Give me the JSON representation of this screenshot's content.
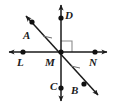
{
  "figure": {
    "type": "geometry-diagram",
    "colors": {
      "line": "#1a1a1a",
      "point": "#111111",
      "label": "#1a1a1a",
      "right_angle": "#8c8c8c",
      "tick": "#6e6e6e",
      "background": "#ffffff"
    },
    "width": 114,
    "height": 106
  },
  "points": [
    {
      "name": "point-a",
      "label": "A",
      "x": 32,
      "y": 22,
      "label_x": 23,
      "label_y": 30
    },
    {
      "name": "point-d",
      "label": "D",
      "x": 61,
      "y": 18,
      "label_x": 65,
      "label_y": 10
    },
    {
      "name": "point-l",
      "label": "L",
      "x": 23,
      "y": 52,
      "label_x": 17,
      "label_y": 57
    },
    {
      "name": "point-m",
      "label": "M",
      "x": 61,
      "y": 52,
      "label_x": 45,
      "label_y": 57
    },
    {
      "name": "point-n",
      "label": "N",
      "x": 95,
      "y": 52,
      "label_x": 89,
      "label_y": 57
    },
    {
      "name": "point-c",
      "label": "C",
      "x": 61,
      "y": 88,
      "label_x": 50,
      "label_y": 81
    },
    {
      "name": "point-b",
      "label": "B",
      "x": 84,
      "y": 84,
      "label_x": 71,
      "label_y": 85
    }
  ],
  "lines": [
    {
      "name": "line-ln",
      "description": "horizontal line through L, M, N with arrowheads both ends",
      "x1": 8,
      "y1": 52,
      "x2": 108,
      "y2": 52,
      "arrow_start": true,
      "arrow_end": true
    },
    {
      "name": "line-dc",
      "description": "vertical line through D, M, C with arrowheads both ends",
      "x1": 61,
      "y1": 4,
      "x2": 61,
      "y2": 102,
      "arrow_start": true,
      "arrow_end": true
    },
    {
      "name": "line-ab",
      "description": "diagonal line through A, M, B with arrowheads both ends",
      "x1": 25,
      "y1": 15,
      "x2": 99,
      "y2": 96,
      "arrow_start": true,
      "arrow_end": true
    }
  ],
  "markers": {
    "right_angle": {
      "name": "right-angle-marker",
      "description": "square marker between ray MD and ray MN in upper-right quadrant",
      "x": 61,
      "y": 52,
      "size": 11
    },
    "congruence_ticks": [
      {
        "name": "tick-upper-left",
        "x": 47,
        "y": 37
      },
      {
        "name": "tick-lower-right",
        "x": 75,
        "y": 67
      }
    ]
  }
}
